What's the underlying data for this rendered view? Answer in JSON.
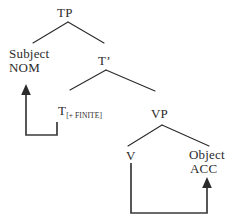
{
  "figure": {
    "type": "syntax-tree",
    "ink_color": "#2b2b2b",
    "background_color": "#ffffff"
  },
  "nodes": {
    "tp": {
      "label": "TP",
      "x": 68,
      "y": 13
    },
    "tbar": {
      "label": "T’",
      "x": 106,
      "y": 61
    },
    "subject": {
      "line1": "Subject",
      "line2": "NOM",
      "x": 28,
      "y": 54
    },
    "t_head": {
      "label": "T",
      "subscript": "[+ FINITE]",
      "x": 64,
      "y": 111
    },
    "vp": {
      "label": "VP",
      "x": 162,
      "y": 114
    },
    "v": {
      "label": "V",
      "x": 131,
      "y": 156
    },
    "object": {
      "line1": "Object",
      "line2": "ACC",
      "x": 207,
      "y": 155
    }
  },
  "branches": [
    {
      "name": "tp-to-subject",
      "from": [
        68,
        22
      ],
      "to": [
        33,
        43
      ]
    },
    {
      "name": "tp-to-tbar",
      "from": [
        68,
        22
      ],
      "to": [
        104,
        43
      ]
    },
    {
      "name": "tbar-to-t",
      "from": [
        106,
        70
      ],
      "to": [
        70,
        90
      ]
    },
    {
      "name": "tbar-to-vp",
      "from": [
        106,
        70
      ],
      "to": [
        155,
        91
      ]
    },
    {
      "name": "vp-to-v",
      "from": [
        162,
        125
      ],
      "to": [
        128,
        146
      ]
    },
    {
      "name": "vp-to-object",
      "from": [
        162,
        125
      ],
      "to": [
        209,
        146
      ]
    }
  ],
  "arrows": [
    {
      "name": "nominative-case-arrow",
      "label": "T[+FINITE] assigns NOM to Subject",
      "path": "M57,122 L57,135 L26,135 L26,92",
      "head_at": [
        26,
        86
      ],
      "head_direction": "up"
    },
    {
      "name": "accusative-case-arrow",
      "label": "V assigns ACC to Object",
      "path": "M131,163 L131,213 L207,213 L207,186",
      "head_at": [
        207,
        179
      ],
      "head_direction": "up"
    }
  ]
}
